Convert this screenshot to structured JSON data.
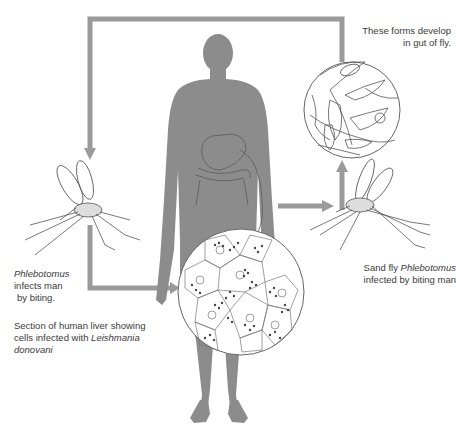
{
  "diagram": {
    "colors": {
      "arrow": "#9a9a9a",
      "human_silhouette": "#8c8c8c",
      "line_art": "#555555",
      "text": "#3a3a3a",
      "background": "#ffffff"
    },
    "labels": {
      "gut_forms": {
        "line1": "These forms develop",
        "line2": "in gut of fly."
      },
      "fly_infects_man": {
        "line1_italic": "Phlebotomus",
        "line2": "infects man",
        "line3": "by biting."
      },
      "liver_section": {
        "line1": "Section of human liver showing",
        "line2_prefix": "cells infected with ",
        "line2_italic": "Leishmania",
        "line3_italic": "donovani"
      },
      "sandfly_infected": {
        "line1_prefix": "Sand fly ",
        "line1_italic": "Phlebotomus",
        "line2": "infected by biting man"
      }
    },
    "nodes": [
      {
        "id": "human",
        "name": "Human silhouette with liver and intestines outlined"
      },
      {
        "id": "liver_magnified",
        "name": "Magnified circle of liver tissue with infected cells"
      },
      {
        "id": "gut_forms_magnified",
        "name": "Magnified circle of flagellated promastigote forms"
      },
      {
        "id": "fly_left",
        "name": "Sand fly (Phlebotomus) biting human"
      },
      {
        "id": "fly_right",
        "name": "Sand fly (Phlebotomus) infected by biting man"
      }
    ],
    "arrows": [
      {
        "from": "gut_forms_magnified",
        "to": "fly_left",
        "path": "top loop from right circle over head down to left fly"
      },
      {
        "from": "fly_left",
        "to": "liver_magnified",
        "path": "down from left fly then right into liver circle"
      },
      {
        "from": "human",
        "to": "fly_right",
        "path": "right from body to right fly"
      },
      {
        "from": "fly_right",
        "to": "gut_forms_magnified",
        "path": "up from right fly into gut circle"
      }
    ]
  }
}
